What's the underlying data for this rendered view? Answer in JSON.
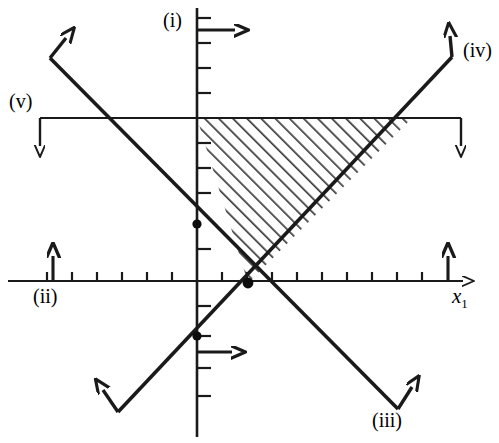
{
  "figure": {
    "type": "inequality-region-plot",
    "background_color": "#ffffff",
    "line_color": "#1a1a1a",
    "hatch_color": "#3a3a3a",
    "width": 499,
    "height": 443
  },
  "axes": {
    "origin": {
      "x": 197,
      "y": 281
    },
    "tick_spacing": 25,
    "x_axis": {
      "name": "x1-axis",
      "label": "x",
      "label_subscript": "1",
      "label_x": 455,
      "label_y": 288,
      "start_x": 8,
      "end_x": 470,
      "y": 281,
      "arrow": "right",
      "ticks": [
        47,
        72,
        97,
        122,
        147,
        172,
        222,
        247,
        272,
        297,
        322,
        347,
        372,
        397,
        422
      ],
      "tick_length": 9
    },
    "y_axis": {
      "name": "x2-axis",
      "x": 197,
      "start_y": 8,
      "end_y": 435,
      "arrow": "none",
      "ticks": [
        18,
        43,
        68,
        93,
        118,
        143,
        168,
        193,
        218,
        243,
        306,
        331,
        356,
        381
      ],
      "tick_length": 9
    }
  },
  "constraint_lines": [
    {
      "id": "i",
      "name": "constraint-line-i",
      "label": "(i)",
      "label_x": 166,
      "label_y": 12,
      "geometry": "vertical-axis-segment",
      "feasible_arrow": {
        "from_x": 197,
        "from_y": 30,
        "to_x": 243,
        "to_y": 30,
        "direction": "right"
      }
    },
    {
      "id": "ii",
      "name": "constraint-line-ii",
      "label": "(ii)",
      "label_x": 37,
      "label_y": 290,
      "geometry": "horizontal-axis-segment",
      "feasible_arrow": {
        "from_x": 53,
        "from_y": 281,
        "to_x": 53,
        "to_y": 252,
        "direction": "up"
      },
      "second_arrow": {
        "from_x": 448,
        "from_y": 281,
        "to_x": 448,
        "to_y": 252,
        "direction": "up"
      }
    },
    {
      "id": "iii",
      "name": "constraint-line-iii",
      "label": "(iii)",
      "label_x": 373,
      "label_y": 415,
      "geometry": "diagonal-up-right",
      "x1": 118,
      "y1": 410,
      "x2": 408,
      "y2": 405,
      "slope": "positive-then-to-lower-right",
      "feasible_arrow": {
        "from_x": 197,
        "from_y": 352,
        "to_x": 243,
        "to_y": 352,
        "direction": "right"
      }
    },
    {
      "id": "iv",
      "name": "constraint-line-iv",
      "label": "(iv)",
      "label_x": 462,
      "label_y": 47,
      "geometry": "diagonal-up-right",
      "feasible_arrow_direction": "up-left"
    },
    {
      "id": "v",
      "name": "constraint-line-v",
      "label": "(v)",
      "label_x": 10,
      "label_y": 95,
      "geometry": "horizontal",
      "y": 118,
      "start_x": 40,
      "end_x": 461,
      "feasible_arrow_left": {
        "from_x": 40,
        "from_y": 118,
        "to_x": 40,
        "to_y": 152,
        "direction": "down"
      },
      "feasible_arrow_right": {
        "from_x": 461,
        "from_y": 118,
        "to_x": 461,
        "to_y": 152,
        "direction": "down"
      }
    }
  ],
  "feasible_region": {
    "name": "shaded-feasible-region",
    "shape": "triangle",
    "fill": "diagonal-hatch",
    "vertices": [
      {
        "x": 197,
        "y": 118
      },
      {
        "x": 412,
        "y": 118
      },
      {
        "x": 248,
        "y": 283
      }
    ]
  },
  "marked_points": [
    {
      "name": "vertex-point-upper",
      "x": 197,
      "y": 224
    },
    {
      "name": "vertex-point-origin-cross",
      "x": 248,
      "y": 283
    },
    {
      "name": "vertex-point-lower",
      "x": 197,
      "y": 336
    }
  ],
  "diagonal_segments": [
    {
      "name": "line-v-descending-segment",
      "x1": 50,
      "y1": 55,
      "x2": 248,
      "y2": 283
    },
    {
      "name": "line-descending-to-lower-right",
      "x1": 248,
      "y1": 283,
      "x2": 398,
      "y2": 412
    },
    {
      "name": "line-iv-ascending-segment",
      "x1": 248,
      "y1": 283,
      "x2": 452,
      "y2": 57
    },
    {
      "name": "line-iii-ascending-lower-left",
      "x1": 118,
      "y1": 408,
      "x2": 248,
      "y2": 283
    }
  ]
}
